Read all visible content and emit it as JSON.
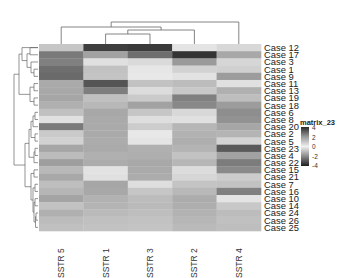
{
  "chart_data": {
    "type": "heatmap",
    "title": "",
    "legend_title": "matrix_23",
    "legend_ticks": [
      "4",
      "2",
      "0",
      "-2",
      "-4"
    ],
    "legend_range": [
      -4,
      4
    ],
    "color_scale": "diverging grayscale (dark at +4 and -4, light near 0)",
    "columns": [
      "SSTR 5",
      "SSTR 1",
      "SSTR 3",
      "SSTR 2",
      "SSTR 4"
    ],
    "rows": [
      "Case 12",
      "Case 17",
      "Case 3",
      "Case 1",
      "Case 9",
      "Case 11",
      "Case 13",
      "Case 19",
      "Case 18",
      "Case 6",
      "Case 8",
      "Case 20",
      "Case 2",
      "Case 5",
      "Case 23",
      "Case 4",
      "Case 22",
      "Case 15",
      "Case 21",
      "Case 7",
      "Case 16",
      "Case 10",
      "Case 14",
      "Case 24",
      "Case 26",
      "Case 25"
    ],
    "cell_gray": [
      [
        "#c6c6c6",
        "#3e3e3e",
        "#3a3a3a",
        "#e4e4e4",
        "#d8d8d8"
      ],
      [
        "#7a7a7a",
        "#a2a2a2",
        "#6e6e6e",
        "#333333",
        "#a8a8a8"
      ],
      [
        "#808080",
        "#e0e0e0",
        "#dadada",
        "#9a9a9a",
        "#d6d6d6"
      ],
      [
        "#6e6e6e",
        "#c2c2c2",
        "#e6e6e6",
        "#d2d2d2",
        "#d0d0d0"
      ],
      [
        "#6a6a6a",
        "#c4c4c4",
        "#e8e8e8",
        "#e2e2e2",
        "#9c9c9c"
      ],
      [
        "#aaaaaa",
        "#555555",
        "#c2c2c2",
        "#bcbcbc",
        "#e0e0e0"
      ],
      [
        "#a8a8a8",
        "#7e7e7e",
        "#dcdcdc",
        "#c8c8c8",
        "#b0b0b0"
      ],
      [
        "#a6a6a6",
        "#c0c0c0",
        "#cacaca",
        "#808080",
        "#bebebe"
      ],
      [
        "#b0b0b0",
        "#b8b8b8",
        "#a2a2a2",
        "#888888",
        "#9c9c9c"
      ],
      [
        "#c0c0c0",
        "#a8a8a8",
        "#c6c6c6",
        "#d8d8d8",
        "#8e8e8e"
      ],
      [
        "#e0e0e0",
        "#aaaaaa",
        "#dedede",
        "#e0e0e0",
        "#929292"
      ],
      [
        "#7a7a7a",
        "#aaaaaa",
        "#cccccc",
        "#b6b6b6",
        "#a6a6a6"
      ],
      [
        "#cacaca",
        "#aaaaaa",
        "#e8e8e8",
        "#b2b2b2",
        "#b4b4b4"
      ],
      [
        "#d2d2d2",
        "#acacac",
        "#e4e4e4",
        "#aeaeae",
        "#d4d4d4"
      ],
      [
        "#a6a6a6",
        "#aaaaaa",
        "#b0b0b0",
        "#b4b4b4",
        "#5a5a5a"
      ],
      [
        "#bcbcbc",
        "#b0b0b0",
        "#aeaeae",
        "#c2c2c2",
        "#a2a2a2"
      ],
      [
        "#9e9e9e",
        "#acacac",
        "#a8a8a8",
        "#b6b6b6",
        "#7c7c7c"
      ],
      [
        "#b8b8b8",
        "#e2e2e2",
        "#aaaaaa",
        "#dcdcdc",
        "#8a8a8a"
      ],
      [
        "#a8a8a8",
        "#e0e0e0",
        "#acacac",
        "#d6d6d6",
        "#cccccc"
      ],
      [
        "#bebebe",
        "#a6a6a6",
        "#dedede",
        "#c4c4c4",
        "#c2c2c2"
      ],
      [
        "#b6b6b6",
        "#a8a8a8",
        "#c6c6c6",
        "#b8b8b8",
        "#808080"
      ],
      [
        "#a4a4a4",
        "#b2b2b2",
        "#bcbcbc",
        "#acacac",
        "#e4e4e4"
      ],
      [
        "#c2c2c2",
        "#b4b4b4",
        "#bababa",
        "#aeaeae",
        "#c8c8c8"
      ],
      [
        "#b0b0b0",
        "#bababa",
        "#bebebe",
        "#b2b2b2",
        "#bcbcbc"
      ],
      [
        "#bcbcbc",
        "#c0c0c0",
        "#c2c2c2",
        "#b6b6b6",
        "#c0c0c0"
      ],
      [
        "#c0c0c0",
        "#c2c2c2",
        "#c4c4c4",
        "#bababa",
        "#bebebe"
      ]
    ],
    "column_dendrogram": "((SSTR 5,((SSTR 1,SSTR 3),SSTR 2)),SSTR 4)",
    "row_dendrogram_present": true,
    "xlabel": "",
    "ylabel": ""
  }
}
